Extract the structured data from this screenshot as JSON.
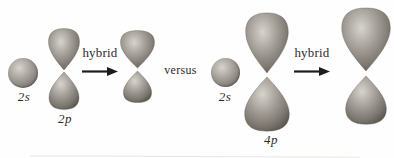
{
  "figure": {
    "left_comparison": {
      "s_orbital_label": "2s",
      "p_orbital_label": "2p",
      "arrow_label": "hybrid"
    },
    "separator_label": "versus",
    "right_comparison": {
      "s_orbital_label": "2s",
      "p_orbital_label": "4p",
      "arrow_label": "hybrid"
    }
  },
  "colors": {
    "background": "#fefefe",
    "text": "#2e2b29",
    "arrow": "#1c1c1c",
    "orbital_highlight": "#d7d3cd",
    "orbital_mid": "#a29d97",
    "orbital_dark": "#7b756e",
    "orbital_edge": "#5b5651"
  }
}
